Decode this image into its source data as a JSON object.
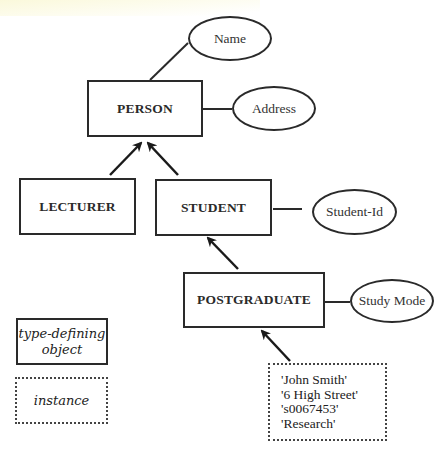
{
  "diagram": {
    "type_objects": [
      {
        "id": "person",
        "label": "PERSON"
      },
      {
        "id": "lecturer",
        "label": "LECTURER"
      },
      {
        "id": "student",
        "label": "STUDENT"
      },
      {
        "id": "postgraduate",
        "label": "POSTGRADUATE"
      }
    ],
    "attributes": [
      {
        "id": "name",
        "label": "Name",
        "of": "PERSON"
      },
      {
        "id": "address",
        "label": "Address",
        "of": "PERSON"
      },
      {
        "id": "student_id",
        "label": "Student-Id",
        "of": "STUDENT"
      },
      {
        "id": "study_mode",
        "label": "Study Mode",
        "of": "POSTGRADUATE"
      }
    ],
    "inheritance": [
      {
        "from": "LECTURER",
        "to": "PERSON"
      },
      {
        "from": "STUDENT",
        "to": "PERSON"
      },
      {
        "from": "POSTGRADUATE",
        "to": "STUDENT"
      }
    ],
    "instance": {
      "of": "POSTGRADUATE",
      "values": [
        "'John Smith'",
        "'6 High Street'",
        "'s0067453'",
        "'Research'"
      ]
    },
    "legend": {
      "type_defining_line1": "type-defining",
      "type_defining_line2": "object",
      "instance": "instance"
    }
  }
}
